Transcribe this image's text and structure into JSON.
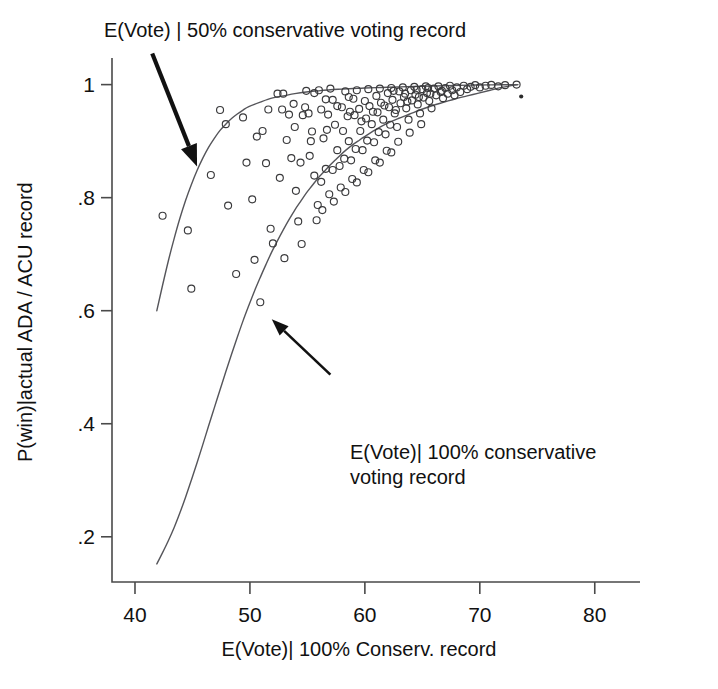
{
  "chart_data": {
    "type": "scatter",
    "title": "",
    "subtitle": "",
    "xlabel": "E(Vote)| 100% Conserv. record",
    "ylabel": "P(win)|actual ADA / ACU record",
    "xlim": [
      38.0,
      81.5
    ],
    "ylim": [
      0.12,
      1.04
    ],
    "xticks": [
      40,
      50,
      60,
      70,
      80
    ],
    "xticklabels": [
      "40",
      "50",
      "60",
      "70",
      "80"
    ],
    "yticks": [
      0.2,
      0.4,
      0.6,
      0.8,
      1.0
    ],
    "yticklabels": [
      ".2",
      ".4",
      ".6",
      ".8",
      "1"
    ],
    "grid": false,
    "legend": "none",
    "annotations": [
      {
        "name": "upper-curve-annotation",
        "text": "E(Vote) | 50% conservative voting record",
        "arrow_from": [
          41.5,
          1.055
        ],
        "arrow_to": [
          45.4,
          0.855
        ]
      },
      {
        "name": "lower-curve-annotation",
        "text": "E(Vote)| 100% conservative\nvoting record",
        "arrow_from": [
          57.0,
          0.487
        ],
        "arrow_to": [
          51.9,
          0.585
        ]
      }
    ],
    "series": [
      {
        "name": "E(Vote) | 50% conservative voting record",
        "type": "line",
        "points": [
          [
            41.9,
            0.6
          ],
          [
            42.4,
            0.645
          ],
          [
            42.9,
            0.688
          ],
          [
            43.4,
            0.727
          ],
          [
            43.9,
            0.763
          ],
          [
            44.4,
            0.795
          ],
          [
            44.9,
            0.823
          ],
          [
            45.4,
            0.848
          ],
          [
            45.9,
            0.87
          ],
          [
            46.4,
            0.889
          ],
          [
            46.9,
            0.905
          ],
          [
            47.4,
            0.919
          ],
          [
            47.9,
            0.93
          ],
          [
            48.4,
            0.94
          ],
          [
            48.9,
            0.948
          ],
          [
            49.4,
            0.955
          ],
          [
            49.9,
            0.961
          ],
          [
            50.9,
            0.969
          ],
          [
            51.9,
            0.976
          ],
          [
            52.9,
            0.98
          ],
          [
            53.9,
            0.984
          ],
          [
            54.9,
            0.987
          ],
          [
            55.9,
            0.989
          ],
          [
            57.0,
            0.991
          ],
          [
            58.0,
            0.992
          ],
          [
            59.0,
            0.993
          ],
          [
            60.0,
            0.994
          ],
          [
            61.5,
            0.995
          ],
          [
            63.0,
            0.996
          ],
          [
            65.0,
            0.997
          ],
          [
            67.0,
            0.998
          ],
          [
            69.0,
            0.999
          ],
          [
            71.0,
            0.9995
          ],
          [
            73.3,
            1.0
          ]
        ]
      },
      {
        "name": "E(Vote)| 100% conservative voting record",
        "type": "line",
        "points": [
          [
            41.9,
            0.152
          ],
          [
            42.4,
            0.172
          ],
          [
            42.9,
            0.193
          ],
          [
            43.4,
            0.216
          ],
          [
            43.9,
            0.242
          ],
          [
            44.4,
            0.27
          ],
          [
            44.9,
            0.3
          ],
          [
            45.4,
            0.331
          ],
          [
            45.9,
            0.363
          ],
          [
            46.4,
            0.396
          ],
          [
            46.9,
            0.428
          ],
          [
            47.4,
            0.46
          ],
          [
            47.9,
            0.492
          ],
          [
            48.4,
            0.523
          ],
          [
            48.9,
            0.553
          ],
          [
            49.4,
            0.582
          ],
          [
            49.9,
            0.609
          ],
          [
            50.4,
            0.635
          ],
          [
            50.9,
            0.659
          ],
          [
            51.4,
            0.682
          ],
          [
            51.9,
            0.704
          ],
          [
            52.4,
            0.724
          ],
          [
            52.9,
            0.743
          ],
          [
            53.4,
            0.761
          ],
          [
            53.9,
            0.778
          ],
          [
            54.4,
            0.793
          ],
          [
            54.9,
            0.808
          ],
          [
            55.4,
            0.821
          ],
          [
            55.9,
            0.834
          ],
          [
            56.4,
            0.845
          ],
          [
            56.9,
            0.856
          ],
          [
            57.4,
            0.866
          ],
          [
            57.9,
            0.876
          ],
          [
            58.4,
            0.885
          ],
          [
            58.9,
            0.893
          ],
          [
            59.4,
            0.9
          ],
          [
            59.9,
            0.907
          ],
          [
            60.9,
            0.92
          ],
          [
            61.9,
            0.931
          ],
          [
            62.9,
            0.94
          ],
          [
            63.9,
            0.948
          ],
          [
            64.9,
            0.956
          ],
          [
            65.9,
            0.963
          ],
          [
            66.9,
            0.969
          ],
          [
            67.9,
            0.975
          ],
          [
            68.9,
            0.98
          ],
          [
            69.9,
            0.985
          ],
          [
            70.9,
            0.99
          ],
          [
            71.9,
            0.995
          ],
          [
            73.3,
            1.0
          ]
        ]
      },
      {
        "name": "observed legislators",
        "type": "scatter",
        "marker": "open-circle",
        "points": [
          [
            42.4,
            0.768
          ],
          [
            44.6,
            0.742
          ],
          [
            44.9,
            0.639
          ],
          [
            46.6,
            0.84
          ],
          [
            47.4,
            0.955
          ],
          [
            47.9,
            0.93
          ],
          [
            48.1,
            0.786
          ],
          [
            48.8,
            0.665
          ],
          [
            49.4,
            0.942
          ],
          [
            50.2,
            0.797
          ],
          [
            50.4,
            0.69
          ],
          [
            50.9,
            0.615
          ],
          [
            51.1,
            0.918
          ],
          [
            51.4,
            0.861
          ],
          [
            51.8,
            0.745
          ],
          [
            52.0,
            0.719
          ],
          [
            52.4,
            0.984
          ],
          [
            52.9,
            0.984
          ],
          [
            53.2,
            0.902
          ],
          [
            53.4,
            0.947
          ],
          [
            53.6,
            0.87
          ],
          [
            53.9,
            0.925
          ],
          [
            54.0,
            0.812
          ],
          [
            54.2,
            0.758
          ],
          [
            54.4,
            0.862
          ],
          [
            54.6,
            0.946
          ],
          [
            54.9,
            0.989
          ],
          [
            55.1,
            0.949
          ],
          [
            55.2,
            0.874
          ],
          [
            55.4,
            0.917
          ],
          [
            55.6,
            0.839
          ],
          [
            55.8,
            0.76
          ],
          [
            56.0,
            0.99
          ],
          [
            56.2,
            0.956
          ],
          [
            56.4,
            0.905
          ],
          [
            56.6,
            0.851
          ],
          [
            56.8,
            0.947
          ],
          [
            57.0,
            0.993
          ],
          [
            57.2,
            0.973
          ],
          [
            57.4,
            0.929
          ],
          [
            57.6,
            0.884
          ],
          [
            57.8,
            0.856
          ],
          [
            58.0,
            0.96
          ],
          [
            58.1,
            0.918
          ],
          [
            58.3,
            0.988
          ],
          [
            58.5,
            0.944
          ],
          [
            58.6,
            0.9
          ],
          [
            58.8,
            0.866
          ],
          [
            59.0,
            0.975
          ],
          [
            59.1,
            0.946
          ],
          [
            59.3,
            0.99
          ],
          [
            59.5,
            0.957
          ],
          [
            59.6,
            0.918
          ],
          [
            59.8,
            0.884
          ],
          [
            60.0,
            0.971
          ],
          [
            60.1,
            0.94
          ],
          [
            60.3,
            0.992
          ],
          [
            60.4,
            0.962
          ],
          [
            60.6,
            0.93
          ],
          [
            60.8,
            0.898
          ],
          [
            61.0,
            0.98
          ],
          [
            61.1,
            0.951
          ],
          [
            61.3,
            0.993
          ],
          [
            61.4,
            0.968
          ],
          [
            61.6,
            0.938
          ],
          [
            61.8,
            0.912
          ],
          [
            62.0,
            0.985
          ],
          [
            62.1,
            0.96
          ],
          [
            62.3,
            0.994
          ],
          [
            62.4,
            0.973
          ],
          [
            62.6,
            0.949
          ],
          [
            62.8,
            0.925
          ],
          [
            63.0,
            0.988
          ],
          [
            63.1,
            0.967
          ],
          [
            63.3,
            0.995
          ],
          [
            63.4,
            0.978
          ],
          [
            63.6,
            0.958
          ],
          [
            63.8,
            0.938
          ],
          [
            64.0,
            0.99
          ],
          [
            64.1,
            0.972
          ],
          [
            64.3,
            0.996
          ],
          [
            64.4,
            0.982
          ],
          [
            64.6,
            0.965
          ],
          [
            64.8,
            0.949
          ],
          [
            65.0,
            0.992
          ],
          [
            65.1,
            0.977
          ],
          [
            65.3,
            0.997
          ],
          [
            65.4,
            0.985
          ],
          [
            65.6,
            0.971
          ],
          [
            65.8,
            0.958
          ],
          [
            66.0,
            0.993
          ],
          [
            66.2,
            0.981
          ],
          [
            66.4,
            0.997
          ],
          [
            66.6,
            0.987
          ],
          [
            66.8,
            0.976
          ],
          [
            67.0,
            0.994
          ],
          [
            67.2,
            0.984
          ],
          [
            67.4,
            0.998
          ],
          [
            67.6,
            0.99
          ],
          [
            67.8,
            0.981
          ],
          [
            68.0,
            0.995
          ],
          [
            68.3,
            0.987
          ],
          [
            68.6,
            0.998
          ],
          [
            68.9,
            0.992
          ],
          [
            69.2,
            0.996
          ],
          [
            69.6,
            0.999
          ],
          [
            70.0,
            0.995
          ],
          [
            70.5,
            0.998
          ],
          [
            71.0,
            0.9995
          ],
          [
            71.6,
            0.997
          ],
          [
            72.2,
            0.999
          ],
          [
            73.2,
            1.0
          ],
          [
            53.0,
            0.693
          ],
          [
            54.5,
            0.718
          ],
          [
            51.6,
            0.956
          ],
          [
            50.6,
            0.908
          ],
          [
            49.7,
            0.862
          ],
          [
            52.6,
            0.835
          ],
          [
            56.9,
            0.806
          ],
          [
            57.9,
            0.818
          ],
          [
            58.9,
            0.833
          ],
          [
            59.9,
            0.849
          ],
          [
            60.9,
            0.866
          ],
          [
            61.9,
            0.883
          ],
          [
            55.9,
            0.787
          ],
          [
            62.9,
            0.899
          ],
          [
            63.9,
            0.915
          ],
          [
            64.9,
            0.93
          ],
          [
            56.3,
            0.778
          ],
          [
            57.3,
            0.793
          ],
          [
            58.3,
            0.81
          ],
          [
            59.3,
            0.827
          ],
          [
            60.3,
            0.845
          ],
          [
            61.3,
            0.862
          ],
          [
            62.3,
            0.88
          ],
          [
            60.2,
            0.901
          ],
          [
            61.2,
            0.916
          ],
          [
            62.2,
            0.929
          ],
          [
            59.2,
            0.886
          ],
          [
            58.2,
            0.869
          ],
          [
            57.2,
            0.849
          ],
          [
            56.2,
            0.828
          ],
          [
            55.3,
            0.9
          ],
          [
            56.7,
            0.92
          ],
          [
            54.8,
            0.96
          ],
          [
            53.8,
            0.966
          ],
          [
            52.8,
            0.956
          ],
          [
            58.7,
            0.952
          ],
          [
            59.7,
            0.935
          ],
          [
            60.7,
            0.952
          ],
          [
            61.7,
            0.963
          ],
          [
            62.7,
            0.955
          ],
          [
            63.7,
            0.97
          ],
          [
            64.7,
            0.978
          ],
          [
            65.7,
            0.984
          ],
          [
            66.7,
            0.989
          ],
          [
            57.6,
            0.962
          ],
          [
            56.6,
            0.974
          ],
          [
            58.6,
            0.978
          ],
          [
            55.6,
            0.985
          ],
          [
            62.5,
            0.989
          ],
          [
            63.5,
            0.984
          ],
          [
            64.5,
            0.991
          ],
          [
            65.5,
            0.994
          ]
        ]
      },
      {
        "name": "outlier-dot",
        "type": "scatter",
        "marker": "filled-dot",
        "points": [
          [
            73.6,
            0.979
          ]
        ]
      }
    ]
  },
  "axes": {
    "xlabel": "E(Vote)| 100% Conserv. record",
    "ylabel": "P(win)|actual ADA / ACU record"
  },
  "colors": {
    "curve": "#55555a",
    "marker": "#3a3a3c",
    "axis": "#4a4a4a",
    "text": "#111111",
    "background": "#ffffff"
  }
}
